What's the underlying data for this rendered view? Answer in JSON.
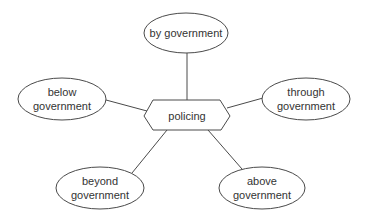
{
  "diagram": {
    "center": {
      "id": "policing",
      "label": "policing",
      "shape": "hexagon"
    },
    "nodes": [
      {
        "id": "by",
        "lines": [
          "by government"
        ],
        "shape": "ellipse"
      },
      {
        "id": "below",
        "lines": [
          "below",
          "government"
        ],
        "shape": "ellipse"
      },
      {
        "id": "through",
        "lines": [
          "through",
          "government"
        ],
        "shape": "ellipse"
      },
      {
        "id": "beyond",
        "lines": [
          "beyond",
          "government"
        ],
        "shape": "ellipse"
      },
      {
        "id": "above",
        "lines": [
          "above",
          "government"
        ],
        "shape": "ellipse"
      }
    ],
    "edges": [
      {
        "from": "policing",
        "to": "by"
      },
      {
        "from": "policing",
        "to": "below"
      },
      {
        "from": "policing",
        "to": "through"
      },
      {
        "from": "policing",
        "to": "beyond"
      },
      {
        "from": "policing",
        "to": "above"
      }
    ],
    "colors": {
      "stroke": "#4a4a4a",
      "text": "#333333",
      "background": "#ffffff"
    }
  }
}
